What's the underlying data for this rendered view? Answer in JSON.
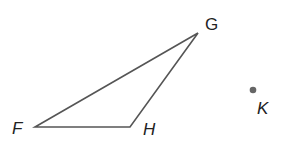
{
  "diagram": {
    "triangle": {
      "vertices": [
        {
          "name": "F",
          "x": 35,
          "y": 127
        },
        {
          "name": "G",
          "x": 198,
          "y": 33
        },
        {
          "name": "H",
          "x": 130,
          "y": 127
        }
      ],
      "stroke": "#555555"
    },
    "point": {
      "name": "K",
      "x": 253,
      "y": 90,
      "color": "#666666"
    },
    "labels": {
      "F": "F",
      "G": "G",
      "H": "H",
      "K": "K"
    }
  }
}
